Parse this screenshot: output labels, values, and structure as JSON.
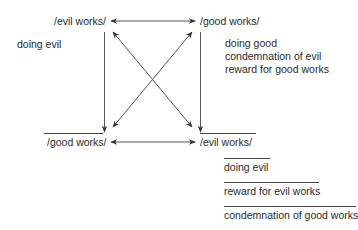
{
  "diagram": {
    "type": "semiotic square",
    "corners": {
      "top_left": {
        "label": "/evil works/",
        "negated": false
      },
      "top_right": {
        "label": "/good works/",
        "negated": false
      },
      "bottom_left": {
        "label": "/good works/",
        "negated": true
      },
      "bottom_right": {
        "label": "/evil works/",
        "negated": true
      }
    },
    "annotations": {
      "top_left": [
        "doing evil"
      ],
      "top_right": [
        "doing good",
        "condemnation of evil",
        "reward for good works"
      ],
      "bottom_right": [
        "doing evil",
        "reward for evil works",
        "condemnation of good works"
      ]
    },
    "relations": [
      {
        "from": "top_left",
        "to": "top_right",
        "kind": "double-arrow"
      },
      {
        "from": "bottom_left",
        "to": "bottom_right",
        "kind": "double-arrow"
      },
      {
        "from": "top_left",
        "to": "bottom_right",
        "kind": "double-arrow-diagonal"
      },
      {
        "from": "top_right",
        "to": "bottom_left",
        "kind": "double-arrow-diagonal"
      },
      {
        "from": "top_left",
        "to": "bottom_left",
        "kind": "arrow"
      },
      {
        "from": "top_right",
        "to": "bottom_right",
        "kind": "arrow"
      }
    ],
    "colors": {
      "line": "#444444",
      "text": "#2a2a2a",
      "background": "#ffffff"
    }
  }
}
